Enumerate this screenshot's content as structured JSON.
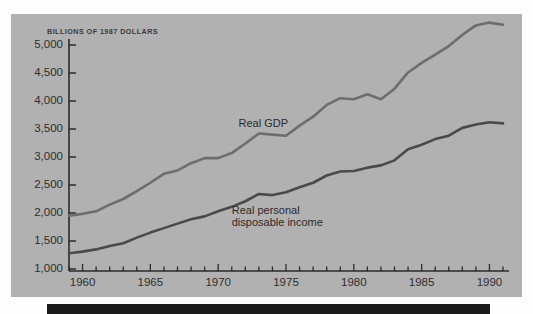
{
  "figure": {
    "panel_color": "#b1b1b1",
    "bottom_bar_color": "#1b1b1b",
    "title": "BILLIONS OF 1987 DOLLARS"
  },
  "chart_data": {
    "type": "line",
    "title": "BILLIONS OF 1987 DOLLARS",
    "xlabel": "",
    "ylabel": "BILLIONS OF 1987 DOLLARS",
    "xlim": [
      1959,
      1991
    ],
    "ylim": [
      900,
      5100
    ],
    "grid": false,
    "legend": "inline-annotations",
    "y_ticks": [
      1000,
      1500,
      2000,
      2500,
      3000,
      3500,
      4000,
      4500,
      5000
    ],
    "y_tick_labels": [
      "1,000",
      "1,500",
      "2,000",
      "2,500",
      "3,000",
      "3,500",
      "4,000",
      "4,500",
      "5,000"
    ],
    "x_ticks": [
      1960,
      1965,
      1970,
      1975,
      1980,
      1985,
      1990
    ],
    "x_tick_labels": [
      "1960",
      "1965",
      "1970",
      "1975",
      "1980",
      "1985",
      "1990"
    ],
    "x_minor_ticks": [
      1959,
      1960,
      1961,
      1962,
      1963,
      1964,
      1965,
      1966,
      1967,
      1968,
      1969,
      1970,
      1971,
      1972,
      1973,
      1974,
      1975,
      1976,
      1977,
      1978,
      1979,
      1980,
      1981,
      1982,
      1983,
      1984,
      1985,
      1986,
      1987,
      1988,
      1989,
      1990,
      1991
    ],
    "x": [
      1959,
      1960,
      1961,
      1962,
      1963,
      1964,
      1965,
      1966,
      1967,
      1968,
      1969,
      1970,
      1971,
      1972,
      1973,
      1974,
      1975,
      1976,
      1977,
      1978,
      1979,
      1980,
      1981,
      1982,
      1983,
      1984,
      1985,
      1986,
      1987,
      1988,
      1989,
      1990,
      1991
    ],
    "series": [
      {
        "name": "Real GDP",
        "color": "#6d6d6d",
        "label_position": "above-line",
        "values": [
          1950,
          1985,
          2030,
          2150,
          2250,
          2390,
          2540,
          2700,
          2760,
          2890,
          2980,
          2980,
          3070,
          3240,
          3420,
          3400,
          3380,
          3560,
          3720,
          3930,
          4050,
          4030,
          4120,
          4030,
          4220,
          4510,
          4680,
          4830,
          4980,
          5180,
          5350,
          5400,
          5360
        ]
      },
      {
        "name": "Real personal disposable income",
        "color": "#4a4a4a",
        "label_position": "below-line",
        "values": [
          1280,
          1310,
          1350,
          1410,
          1460,
          1560,
          1650,
          1730,
          1810,
          1890,
          1940,
          2030,
          2110,
          2210,
          2340,
          2320,
          2370,
          2460,
          2540,
          2670,
          2740,
          2750,
          2810,
          2850,
          2940,
          3140,
          3220,
          3320,
          3380,
          3520,
          3580,
          3620,
          3600
        ]
      }
    ],
    "annotations": [
      {
        "text": "Real GDP",
        "series": "Real GDP",
        "x": 1971.5,
        "y": 3600
      },
      {
        "text": "Real personal disposable income",
        "series": "Real personal disposable income",
        "x": 1971.0,
        "y": 2060
      }
    ]
  }
}
